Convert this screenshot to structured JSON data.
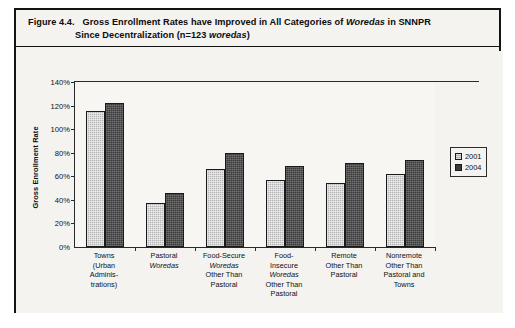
{
  "figure": {
    "number": "Figure 4.4.",
    "title_line1_part1": "Gross Enrollment Rates have Improved in All Categories of ",
    "title_line1_italic": "Woredas",
    "title_line1_part2": " in SNNPR",
    "title_line2_part1": "Since Decentralization (n=123 ",
    "title_line2_italic": "woredas",
    "title_line2_part2": ")"
  },
  "legend": {
    "position": "right",
    "entries": [
      {
        "label": "2001",
        "color": "#b4b4b4"
      },
      {
        "label": "2004",
        "color": "#3b3b3b"
      }
    ]
  },
  "chart_data": {
    "type": "bar",
    "title": "Gross Enrollment Rates have Improved in All Categories of Woredas in SNNPR Since Decentralization (n=123 woredas)",
    "xlabel": "",
    "ylabel": "Gross Enrollment Rate",
    "ylim": [
      0,
      140
    ],
    "ytick_labels": [
      "0%",
      "20%",
      "40%",
      "60%",
      "80%",
      "100%",
      "120%",
      "140%"
    ],
    "ytick_values": [
      0,
      20,
      40,
      60,
      80,
      100,
      120,
      140
    ],
    "grid": false,
    "legend_position": "right",
    "categories": [
      "Towns (Urban Administrations)",
      "Pastoral Woredas",
      "Food-Secure Woredas Other Than Pastoral",
      "Food-Insecure Woredas Other Than Pastoral",
      "Remote Other Than Pastoral",
      "Nonremote Other Than Pastoral and Towns"
    ],
    "category_lines": [
      [
        "Towns",
        "(Urban",
        "Adminis-",
        "trations)"
      ],
      [
        "Pastoral",
        "Woredas"
      ],
      [
        "Food-Secure",
        "Woredas",
        "Other Than",
        "Pastoral"
      ],
      [
        "Food-",
        "Insecure",
        "Woredas",
        "Other Than",
        "Pastoral"
      ],
      [
        "Remote",
        "Other Than",
        "Pastoral"
      ],
      [
        "Nonremote",
        "Other Than",
        "Pastoral and",
        "Towns"
      ]
    ],
    "category_italic_lines": [
      [],
      [
        "Woredas"
      ],
      [
        "Woredas"
      ],
      [
        "Woredas"
      ],
      [],
      []
    ],
    "series": [
      {
        "name": "2001",
        "values": [
          115,
          37,
          66,
          57,
          54,
          62
        ]
      },
      {
        "name": "2004",
        "values": [
          122,
          46,
          80,
          69,
          71,
          74
        ]
      }
    ]
  }
}
